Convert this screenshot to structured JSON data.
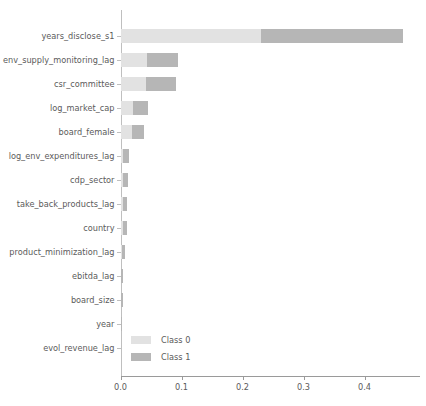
{
  "chart_data": {
    "type": "bar",
    "orientation": "horizontal",
    "stacked": true,
    "title": "",
    "xlabel": "",
    "ylabel": "",
    "xlim": [
      0,
      0.49
    ],
    "grid": false,
    "legend_position": "lower-left-inside",
    "xticks": [
      "0.0",
      "0.1",
      "0.2",
      "0.3",
      "0.4"
    ],
    "xtick_values": [
      0.0,
      0.1,
      0.2,
      0.3,
      0.4
    ],
    "categories": [
      "years_disclose_s1",
      "env_supply_monitoring_lag",
      "csr_committee",
      "log_market_cap",
      "board_female",
      "log_env_expenditures_lag",
      "cdp_sector",
      "take_back_products_lag",
      "country",
      "product_minimization_lag",
      "ebitda_lag",
      "board_size",
      "year",
      "evol_revenue_lag"
    ],
    "series": [
      {
        "name": "Class 0",
        "color": "#e2e2e2",
        "values": [
          0.2303,
          0.0439,
          0.0423,
          0.0205,
          0.0189,
          0.0041,
          0.0041,
          0.0033,
          0.0033,
          0.0025,
          0.0016,
          0.0016,
          0.0012,
          0.0
        ]
      },
      {
        "name": "Class 1",
        "color": "#b6b6b6",
        "values": [
          0.2327,
          0.0504,
          0.0492,
          0.0245,
          0.0196,
          0.0104,
          0.0082,
          0.0074,
          0.0066,
          0.0049,
          0.0033,
          0.0033,
          0.0016,
          0.0
        ]
      }
    ],
    "totals": [
      0.463,
      0.0943,
      0.0915,
      0.045,
      0.0385,
      0.0145,
      0.0123,
      0.0107,
      0.0099,
      0.0074,
      0.0049,
      0.0049,
      0.0028,
      0.0
    ]
  },
  "legend": {
    "entries": [
      {
        "label": "Class 0",
        "color": "#e2e2e2"
      },
      {
        "label": "Class 1",
        "color": "#b6b6b6"
      }
    ]
  },
  "axis": {
    "x_origin_px": 120.5,
    "px_per_unit": 610,
    "row_height_px": 24,
    "first_row_top_px": 14
  }
}
